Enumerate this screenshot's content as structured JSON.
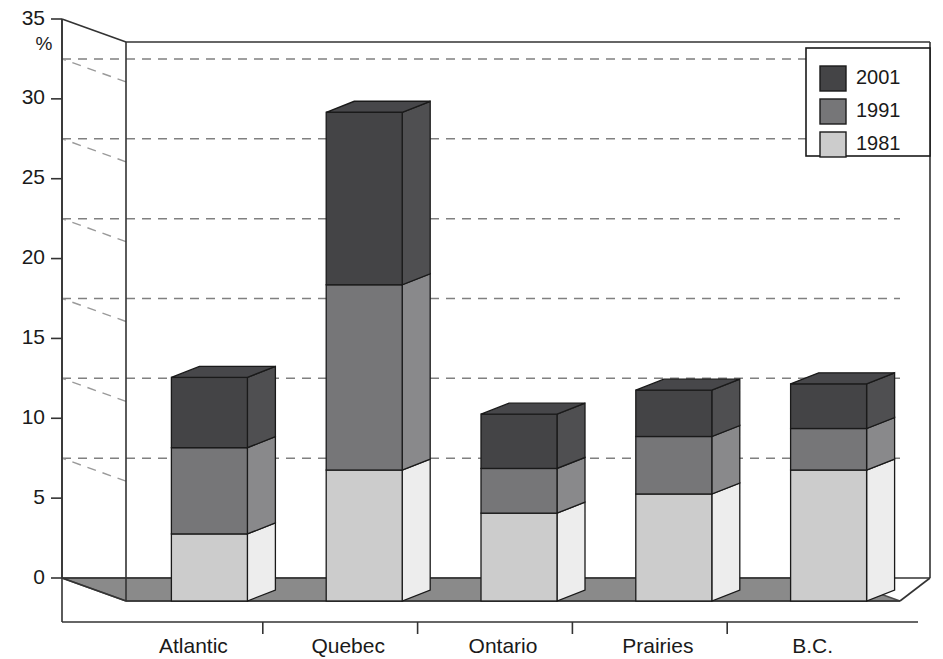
{
  "chart_data": {
    "type": "bar",
    "stacked": true,
    "projection": "3d",
    "title": "",
    "subtitle": "",
    "xlabel": "",
    "ylabel": "%",
    "ylim": [
      0,
      35
    ],
    "yticks": [
      0,
      5,
      10,
      15,
      20,
      25,
      30,
      35
    ],
    "ytick_labels": [
      "0",
      "5",
      "10",
      "15",
      "20",
      "25",
      "30",
      "35"
    ],
    "grid": true,
    "gridlines": [
      7.5,
      12.5,
      17.5,
      22.5,
      27.5,
      32.5
    ],
    "legend_position": "top-right",
    "categories": [
      "Atlantic",
      "Quebec",
      "Ontario",
      "Prairies",
      "B.C."
    ],
    "series": [
      {
        "name": "1981",
        "color": "#cccccc",
        "values": [
          4.2,
          8.2,
          5.5,
          6.7,
          8.2
        ]
      },
      {
        "name": "1991",
        "color": "#767678",
        "values": [
          5.4,
          11.6,
          2.8,
          3.6,
          2.6
        ]
      },
      {
        "name": "2001",
        "color": "#444446",
        "values": [
          4.4,
          10.8,
          3.4,
          2.9,
          2.8
        ]
      }
    ],
    "cumulative_tops": {
      "Atlantic": [
        4.2,
        9.6,
        14.0
      ],
      "Quebec": [
        8.2,
        19.8,
        30.6
      ],
      "Ontario": [
        5.5,
        8.3,
        11.7
      ],
      "Prairies": [
        6.7,
        10.3,
        13.2
      ],
      "B.C.": [
        8.2,
        10.8,
        13.6
      ]
    },
    "totals": [
      14.0,
      30.6,
      11.7,
      13.2,
      13.6
    ]
  },
  "axis": {
    "unit_label": "%",
    "ticks": [
      "35",
      "30",
      "25",
      "20",
      "15",
      "10",
      "5",
      "0"
    ]
  },
  "legend": {
    "entries": [
      {
        "label": "2001",
        "color": "#444446"
      },
      {
        "label": "1991",
        "color": "#767678"
      },
      {
        "label": "1981",
        "color": "#cccccc"
      }
    ]
  },
  "categories": [
    {
      "label": "Atlantic"
    },
    {
      "label": "Quebec"
    },
    {
      "label": "Ontario"
    },
    {
      "label": "Prairies"
    },
    {
      "label": "B.C."
    }
  ],
  "colors": {
    "series_2001": "#444446",
    "series_1991": "#767678",
    "series_1981": "#cccccc",
    "floor": "#8a8a8a",
    "floor_side": "#9c9c9c",
    "outline": "#1a1a1a",
    "gridline": "#808080",
    "background": "#ffffff"
  }
}
